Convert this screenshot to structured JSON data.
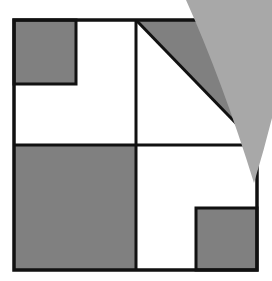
{
  "diagram": {
    "colors": {
      "background": "#ffffff",
      "stroke": "#111111",
      "shade": "#808080",
      "flap": "#a8a8a8"
    },
    "outer_square": {
      "x": 14,
      "y": 20,
      "size": 243
    },
    "quadrants": [
      {
        "name": "top-left",
        "shaded_region": "small square in top-left corner"
      },
      {
        "name": "top-right",
        "shaded_region": "upper-right triangle above diagonal"
      },
      {
        "name": "bottom-left",
        "shaded_region": "entire quadrant"
      },
      {
        "name": "bottom-right",
        "shaded_region": "small square in bottom-right corner"
      }
    ],
    "folded_flap": {
      "covers": "top-right corner"
    }
  }
}
